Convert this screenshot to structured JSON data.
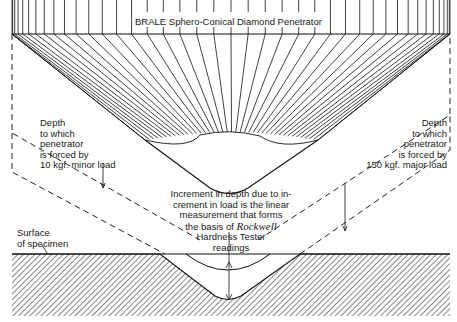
{
  "diagram": {
    "title": "BRALE Sphero-Conical Diamond Penetrator",
    "labels": {
      "minor_load": [
        "Depth",
        "to which",
        "penetrator",
        "is forced by",
        "10 kgf. minor load"
      ],
      "major_load": [
        "Depth",
        "to which",
        "penetrator",
        "is forced by",
        "150 kgf. major load"
      ],
      "increment": {
        "line1": "Increment in depth due to in-",
        "line2": "crement in load is the linear",
        "line3": "measurement that forms",
        "line4_prefix": "the basis of ",
        "line4_emph": "Rockwell",
        "line5": "Hardness Tester",
        "line6": "readings"
      },
      "surface": [
        "Surface",
        "of specimen"
      ]
    },
    "colors": {
      "ink": "#1a1a1a",
      "background": "#ffffff"
    }
  }
}
